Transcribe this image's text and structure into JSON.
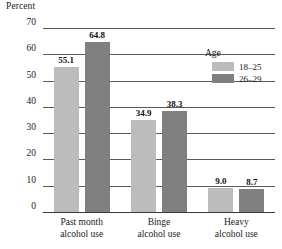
{
  "chart_data": {
    "type": "bar",
    "title": "",
    "subtitle": "",
    "xlabel": "",
    "ylabel": "Percent",
    "ylim": [
      0,
      70
    ],
    "ytick_labels": [
      "70",
      "60",
      "50",
      "40",
      "30",
      "20",
      "10",
      "0"
    ],
    "ytick_values": [
      70,
      60,
      50,
      40,
      30,
      20,
      10,
      0
    ],
    "grid": true,
    "grid_axis": "y",
    "legend_position": "top-right",
    "legend_title": "Age",
    "categories": [
      "Past month\nalcohol use",
      "Binge\nalcohol use",
      "Heavy\nalcohol use"
    ],
    "category_lines": [
      [
        "Past month",
        "alcohol use"
      ],
      [
        "Binge",
        "alcohol use"
      ],
      [
        "Heavy",
        "alcohol use"
      ]
    ],
    "series": [
      {
        "name": "18–25",
        "color": "#bcbcbc",
        "values": [
          55.1,
          34.9,
          9.0
        ],
        "labels": [
          "55.1",
          "34.9",
          "9.0"
        ]
      },
      {
        "name": "26–29",
        "color": "#808080",
        "values": [
          64.8,
          38.3,
          8.7
        ],
        "labels": [
          "64.8",
          "38.3",
          "8.7"
        ]
      }
    ]
  }
}
